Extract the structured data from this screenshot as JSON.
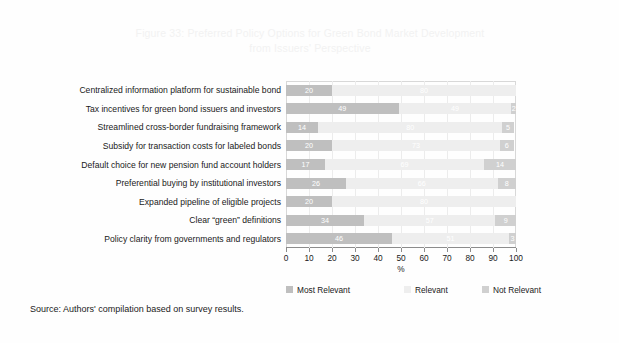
{
  "figure": {
    "title": "Figure 33: Preferred Policy Options for Green Bond Market Development\nfrom Issuers' Perspective",
    "source_note": "Source: Authors' compilation based on survey results."
  },
  "colors": {
    "most_relevant": "#bfbfbf",
    "relevant": "#eeeeee",
    "not_relevant": "#d0d0d0",
    "title_text": "#f2f2f2",
    "axis_line": "#8c8c8c",
    "gridline": "#ececec",
    "body_text": "#1a1a1a",
    "bar_value_text": "#ffffff",
    "background": "#fefefe"
  },
  "chart_data": {
    "type": "bar",
    "orientation": "horizontal",
    "stacked": true,
    "title": "Figure 33: Preferred Policy Options for Green Bond Market Development from Issuers' Perspective",
    "xlabel": "%",
    "ylabel": "",
    "xlim": [
      0,
      100
    ],
    "xticks": [
      0,
      10,
      20,
      30,
      40,
      50,
      60,
      70,
      80,
      90,
      100
    ],
    "xtick_labels": [
      "0",
      "10",
      "20",
      "30",
      "40",
      "50",
      "60",
      "70",
      "80",
      "90",
      "100"
    ],
    "grid": true,
    "legend_position": "bottom",
    "legend": [
      "Most Relevant",
      "Relevant",
      "Not Relevant"
    ],
    "categories": [
      "Centralized information platform for sustainable bond",
      "Tax incentives for green bond issuers and investors",
      "Streamlined cross-border fundraising framework",
      "Subsidy for transaction costs for labeled bonds",
      "Default choice for new pension fund account holders",
      "Preferential buying by institutional investors",
      "Expanded pipeline of eligible projects",
      "Clear “green” definitions",
      "Policy clarity from governments and regulators"
    ],
    "series": [
      {
        "name": "Most Relevant",
        "color": "#bfbfbf",
        "values": [
          20,
          49,
          14,
          20,
          17,
          26,
          20,
          34,
          46
        ]
      },
      {
        "name": "Relevant",
        "color": "#eeeeee",
        "values": [
          80,
          49,
          80,
          73,
          69,
          66,
          80,
          57,
          51
        ]
      },
      {
        "name": "Not Relevant",
        "color": "#d0d0d0",
        "values": [
          0,
          2,
          5,
          6,
          14,
          8,
          0,
          9,
          3
        ]
      }
    ]
  }
}
